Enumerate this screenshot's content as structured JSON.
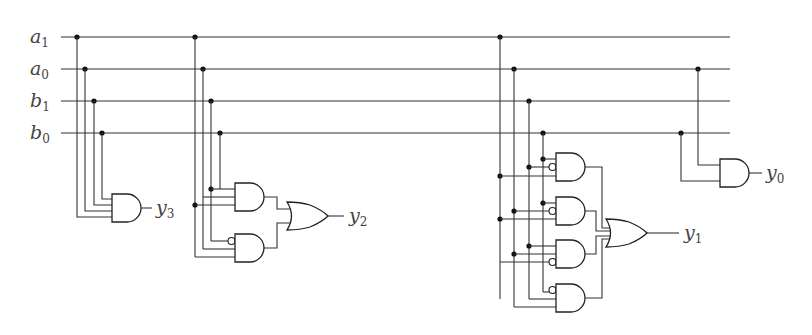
{
  "diagram": {
    "inputs": [
      {
        "base": "a",
        "sub": "1",
        "y": 37
      },
      {
        "base": "a",
        "sub": "0",
        "y": 69
      },
      {
        "base": "b",
        "sub": "1",
        "y": 101
      },
      {
        "base": "b",
        "sub": "0",
        "y": 133
      }
    ],
    "outputs": [
      {
        "base": "y",
        "sub": "3"
      },
      {
        "base": "y",
        "sub": "2"
      },
      {
        "base": "y",
        "sub": "1"
      },
      {
        "base": "y",
        "sub": "0"
      }
    ],
    "gates": {
      "y3": {
        "type": "AND",
        "inputs": 4
      },
      "y2": {
        "type": "OR",
        "inputs": [
          "AND(a1,a0,b0)",
          "AND(a1,b1,¬a0...)"
        ]
      },
      "y1": {
        "type": "OR",
        "inputs": 4,
        "and_gates": 4
      },
      "y0": {
        "type": "AND",
        "inputs": 2
      }
    },
    "colors": {
      "wire": "#333333",
      "gate": "#222222",
      "label": "#444444"
    }
  }
}
